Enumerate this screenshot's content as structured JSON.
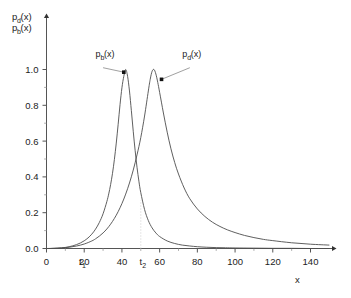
{
  "chart_data": {
    "type": "line",
    "title": "",
    "subtitle": "",
    "xlabel": "x",
    "ylabel_line1": "p",
    "ylabel_line1_sub": "d",
    "ylabel_line1_tail": "(x)",
    "ylabel_line2": "p",
    "ylabel_line2_sub": "b",
    "ylabel_line2_tail": "(x)",
    "xlim": [
      0,
      150
    ],
    "ylim": [
      0,
      1.08
    ],
    "grid": false,
    "legend_position": "inline-annotations",
    "xticks": [
      0,
      20,
      40,
      60,
      80,
      100,
      120,
      140
    ],
    "xtick_labels": [
      "0",
      "20",
      "40",
      "60",
      "80",
      "100",
      "120",
      "140"
    ],
    "xminor_step": 10,
    "yticks": [
      0.0,
      0.2,
      0.4,
      0.6,
      0.8,
      1.0
    ],
    "ytick_labels": [
      "0.0",
      "0.2",
      "0.4",
      "0.6",
      "0.8",
      "1.0"
    ],
    "yminor_step": 0.1,
    "markers": [
      {
        "name": "t1",
        "label": "t",
        "sublabel": "1",
        "x": 18,
        "draw_line": false
      },
      {
        "name": "t2",
        "label": "t",
        "sublabel": "2",
        "x": 50,
        "draw_line": true,
        "line_top": 0.27
      }
    ],
    "annotations": [
      {
        "name": "p_b-annotation",
        "label": "p",
        "sublabel": "b",
        "tail": "(x)",
        "text_x": 26,
        "text_y": 1.07,
        "arrow_from_x": 30,
        "arrow_from_y": 1.01,
        "arrow_to_x": 41,
        "arrow_to_y": 0.985
      },
      {
        "name": "p_d-annotation",
        "label": "p",
        "sublabel": "d",
        "tail": "(x)",
        "text_x": 72,
        "text_y": 1.07,
        "arrow_from_x": 76,
        "arrow_from_y": 1.01,
        "arrow_to_x": 61,
        "arrow_to_y": 0.945
      }
    ],
    "series": [
      {
        "name": "p_b(x)",
        "peak_x": 42,
        "peak_y": 1.0,
        "color": "#4d4d4d",
        "x": [
          0,
          2,
          4,
          6,
          8,
          10,
          12,
          14,
          16,
          18,
          20,
          22,
          24,
          26,
          28,
          30,
          32,
          33,
          34,
          35,
          36,
          37,
          38,
          39,
          40,
          41,
          42,
          43,
          44,
          45,
          46,
          47,
          48,
          49,
          50,
          52,
          54,
          56,
          58,
          60,
          64,
          68,
          72,
          76,
          80,
          85,
          90,
          95,
          100,
          110,
          120,
          130,
          140,
          150
        ],
        "y": [
          0.0,
          0.0,
          0.001,
          0.002,
          0.004,
          0.006,
          0.01,
          0.015,
          0.022,
          0.031,
          0.043,
          0.059,
          0.08,
          0.108,
          0.145,
          0.194,
          0.262,
          0.305,
          0.357,
          0.42,
          0.497,
          0.589,
          0.694,
          0.804,
          0.898,
          0.962,
          1.0,
          0.962,
          0.88,
          0.77,
          0.655,
          0.548,
          0.454,
          0.376,
          0.312,
          0.218,
          0.156,
          0.115,
          0.087,
          0.067,
          0.042,
          0.028,
          0.019,
          0.014,
          0.01,
          0.007,
          0.005,
          0.004,
          0.003,
          0.002,
          0.001,
          0.001,
          0.0,
          0.0
        ]
      },
      {
        "name": "p_d(x)",
        "peak_x": 57,
        "peak_y": 1.0,
        "color": "#4d4d4d",
        "x": [
          0,
          4,
          8,
          12,
          16,
          20,
          24,
          26,
          28,
          30,
          32,
          34,
          36,
          38,
          40,
          42,
          44,
          46,
          48,
          50,
          52,
          54,
          55,
          56,
          57,
          58,
          59,
          60,
          62,
          64,
          66,
          68,
          70,
          73,
          76,
          80,
          84,
          88,
          92,
          96,
          100,
          105,
          110,
          115,
          120,
          130,
          140,
          150
        ],
        "y": [
          0.0,
          0.001,
          0.003,
          0.007,
          0.014,
          0.025,
          0.042,
          0.054,
          0.069,
          0.087,
          0.109,
          0.136,
          0.168,
          0.206,
          0.251,
          0.304,
          0.366,
          0.438,
          0.523,
          0.62,
          0.74,
          0.88,
          0.945,
          0.99,
          1.0,
          0.975,
          0.928,
          0.872,
          0.757,
          0.65,
          0.557,
          0.48,
          0.416,
          0.338,
          0.278,
          0.221,
          0.179,
          0.147,
          0.123,
          0.104,
          0.089,
          0.073,
          0.061,
          0.051,
          0.044,
          0.032,
          0.024,
          0.019
        ]
      }
    ]
  }
}
